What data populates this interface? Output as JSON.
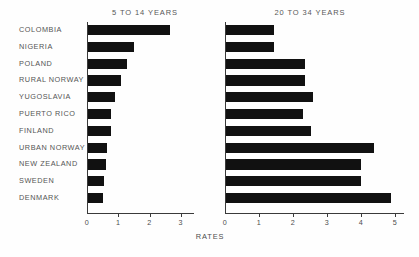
{
  "chart_data": {
    "type": "bar",
    "orientation": "horizontal",
    "title": "",
    "xlabel": "RATES",
    "ylabel": "",
    "grid": false,
    "legend": false,
    "categories": [
      "COLOMBIA",
      "NIGERIA",
      "POLAND",
      "RURAL NORWAY",
      "YUGOSLAVIA",
      "PUERTO RICO",
      "FINLAND",
      "URBAN NORWAY",
      "NEW ZEALAND",
      "SWEDEN",
      "DENMARK"
    ],
    "panels": [
      {
        "title": "5 TO 14 YEARS",
        "xlim": [
          0,
          3.2
        ],
        "xticks": [
          0,
          1,
          2,
          3
        ],
        "xticklabels": [
          "0",
          "1",
          "2",
          "3"
        ],
        "values": [
          2.6,
          1.45,
          1.25,
          1.05,
          0.85,
          0.72,
          0.72,
          0.6,
          0.55,
          0.5,
          0.47
        ]
      },
      {
        "title": "20 TO 34 YEARS",
        "xlim": [
          0,
          5.15
        ],
        "xticks": [
          0,
          1,
          2,
          3,
          4,
          5
        ],
        "xticklabels": [
          "0",
          "1",
          "2",
          "3",
          "4",
          "5"
        ],
        "values": [
          1.4,
          1.4,
          2.3,
          2.3,
          2.55,
          2.25,
          2.5,
          4.35,
          3.95,
          3.95,
          4.85
        ]
      }
    ],
    "series": [
      {
        "name": "5 TO 14 YEARS",
        "values": [
          2.6,
          1.45,
          1.25,
          1.05,
          0.85,
          0.72,
          0.72,
          0.6,
          0.55,
          0.5,
          0.47
        ]
      },
      {
        "name": "20 TO 34 YEARS",
        "values": [
          1.4,
          1.4,
          2.3,
          2.3,
          2.55,
          2.25,
          2.5,
          4.35,
          3.95,
          3.95,
          4.85
        ]
      }
    ],
    "bar_color": "#111111",
    "axis_color": "#3a3a3a",
    "background_color": "#fefefe"
  }
}
